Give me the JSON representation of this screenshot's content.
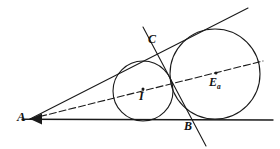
{
  "figure": {
    "canvas": {
      "width": 280,
      "height": 149
    },
    "background_color": "#ffffff",
    "stroke_color": "#1a1a1a"
  },
  "labels": {
    "A": {
      "text": "A",
      "x": 22,
      "y": 117
    },
    "B": {
      "text": "B",
      "x": 189,
      "y": 126
    },
    "C": {
      "text": "C",
      "x": 153,
      "y": 39
    },
    "I": {
      "text": "I",
      "x": 143,
      "y": 96
    },
    "Ea": {
      "text": "E",
      "subscript": "a",
      "x": 216,
      "y": 82
    }
  },
  "points": {
    "A": {
      "x": 30,
      "y": 119
    },
    "B": {
      "x": 185,
      "y": 119
    },
    "C": {
      "x": 160,
      "y": 48
    },
    "I": {
      "x": 143,
      "y": 89
    },
    "Ea": {
      "x": 216,
      "y": 73
    }
  },
  "circles": [
    {
      "name": "incircle",
      "center_label": "I",
      "cx": 143,
      "cy": 91,
      "r": 30,
      "stroke_width": 1.1
    },
    {
      "name": "excircle",
      "center_label": "Ea",
      "cx": 215,
      "cy": 74,
      "r": 45,
      "stroke_width": 1.1
    }
  ],
  "lines": [
    {
      "name": "upper-tangent-ray",
      "from": {
        "x": 30,
        "y": 119
      },
      "to": {
        "x": 248,
        "y": 8
      },
      "style": "solid",
      "stroke_width": 1.1
    },
    {
      "name": "base-line",
      "from": {
        "x": 22,
        "y": 119
      },
      "to": {
        "x": 273,
        "y": 120
      },
      "style": "solid",
      "stroke_width": 1.3
    },
    {
      "name": "angle-bisector-dashed",
      "from": {
        "x": 30,
        "y": 119
      },
      "to": {
        "x": 263,
        "y": 61
      },
      "style": "dashed",
      "dash_pattern": "7,3",
      "stroke_width": 1.1
    },
    {
      "name": "line-through-C-and-B",
      "from": {
        "x": 143,
        "y": 27
      },
      "to": {
        "x": 206,
        "y": 146
      },
      "style": "solid",
      "stroke_width": 1.1
    }
  ],
  "arrow": {
    "name": "vertex-arrowhead",
    "tip": {
      "x": 30,
      "y": 119
    },
    "description": "arrowhead at vertex A pointing left"
  }
}
